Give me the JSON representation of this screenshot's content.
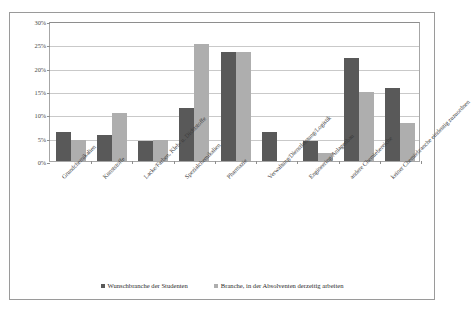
{
  "chart_data": {
    "type": "bar",
    "title": "",
    "subtitle": "",
    "xlabel": "",
    "ylabel": "",
    "ylim": [
      0,
      30
    ],
    "y_tick_labels": [
      "0%",
      "5%",
      "10%",
      "15%",
      "20%",
      "25%",
      "30%"
    ],
    "y_tick_values": [
      0,
      5,
      10,
      15,
      20,
      25,
      30
    ],
    "grid": true,
    "legend_position": "bottom",
    "orientation": "vertical",
    "categories": [
      "Grundchemikalien",
      "Kunststoffe",
      "Lacke/Farben, Kleb- u. Dichtstoffe",
      "Spezialchemikalien",
      "Pharmazie",
      "Verwaltung/Dienstleistung/Logistik",
      "Engineering/Anlagenbau",
      "andere Chemiebereiche",
      "keiner Chemiebranche eindeutig zuzuordnen"
    ],
    "series": [
      {
        "name": "Wunschbranche der Studenten",
        "color": "#595959",
        "values": [
          6.2,
          5.6,
          4.3,
          11.3,
          23.3,
          6.3,
          4.3,
          22.0,
          15.6
        ]
      },
      {
        "name": "Branche, in der Absolventen derzeitig arbeiten",
        "color": "#aeaeae",
        "values": [
          4.6,
          10.2,
          4.6,
          25.1,
          23.3,
          0.0,
          1.7,
          14.8,
          8.2
        ]
      }
    ]
  },
  "legend": {
    "items": [
      {
        "label": "Wunschbranche der Studenten",
        "color": "#595959"
      },
      {
        "label": "Branche, in der Absolventen derzeitig arbeiten",
        "color": "#aeaeae"
      }
    ]
  },
  "colors": {
    "series_dark": "#595959",
    "series_light": "#aeaeae",
    "gridline": "#c9c9c9",
    "axis": "#8e8e8e",
    "frame": "#9a9a9a",
    "background": "#ffffff"
  }
}
